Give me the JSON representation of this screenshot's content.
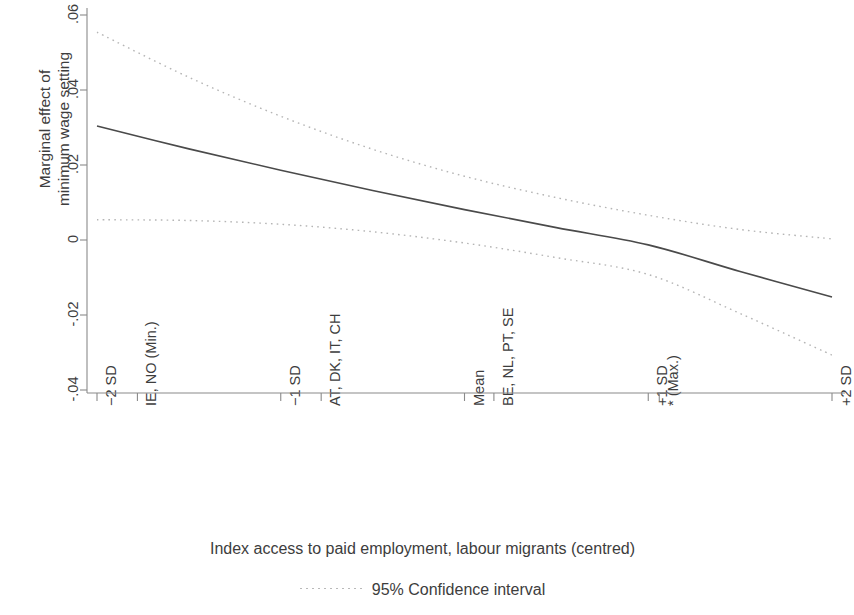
{
  "chart_data": {
    "type": "line",
    "title": "",
    "xlabel": "Index access to paid employment, labour migrants (centred)",
    "ylabel": "Marginal effect of\nminimum wage setting",
    "ylim": [
      -0.05,
      0.065
    ],
    "xlim": [
      -2.15,
      2.15
    ],
    "grid": false,
    "legend_position": "bottom",
    "yticks": [
      ".06",
      ".04",
      ".02",
      "0",
      "-.02",
      "-.04"
    ],
    "ytick_values": [
      0.06,
      0.04,
      0.02,
      0,
      -0.02,
      -0.04
    ],
    "xticks": [
      {
        "label": "-2 SD",
        "value": -2.0
      },
      {
        "label": "IE, NO (Min.)",
        "value": -1.78
      },
      {
        "label": "-1 SD",
        "value": -1.0
      },
      {
        "label": "AT, DK, IT, CH",
        "value": -0.78
      },
      {
        "label": "Mean",
        "value": 0.0
      },
      {
        "label": "BE, NL, PT, SE",
        "value": 0.16
      },
      {
        "label": "+1 SD",
        "value": 1.0
      },
      {
        "label": "* (Max.)",
        "value": 1.06
      },
      {
        "label": "+2 SD",
        "value": 2.0
      }
    ],
    "series": [
      {
        "name": "Marginal effect",
        "style": "solid",
        "color": "#4a4a4a",
        "x": [
          -2.0,
          -1.5,
          -1.0,
          -0.5,
          0.0,
          0.5,
          1.0,
          1.5,
          2.0
        ],
        "y": [
          0.0304,
          0.0243,
          0.0186,
          0.0132,
          0.0081,
          0.0033,
          -0.0013,
          -0.0084,
          -0.0152
        ]
      },
      {
        "name": "95% Confidence interval upper",
        "style": "dotted",
        "color": "#b5b5b5",
        "x": [
          -2.0,
          -1.5,
          -1.0,
          -0.5,
          0.0,
          0.5,
          1.0,
          1.5,
          2.0
        ],
        "y": [
          0.0554,
          0.0434,
          0.033,
          0.0242,
          0.017,
          0.0113,
          0.0066,
          0.0028,
          0.0003
        ]
      },
      {
        "name": "95% Confidence interval lower",
        "style": "dotted",
        "color": "#b5b5b5",
        "x": [
          -2.0,
          -1.5,
          -1.0,
          -0.5,
          0.0,
          0.5,
          1.0,
          1.5,
          2.0
        ],
        "y": [
          0.0054,
          0.0052,
          0.0042,
          0.0022,
          -0.0008,
          -0.0047,
          -0.0092,
          -0.0196,
          -0.0307
        ]
      }
    ],
    "legend": [
      {
        "label": "95% Confidence interval",
        "style": "dotted",
        "color": "#b5b5b5"
      }
    ],
    "axis_color": "#8a8a8a",
    "accent_color": "#4a4a4a"
  }
}
